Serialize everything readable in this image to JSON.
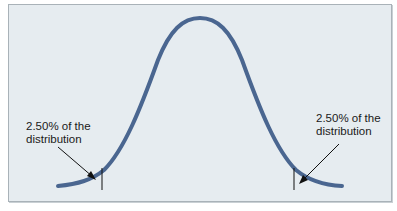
{
  "figure": {
    "type": "normal-distribution-diagram",
    "background_color": "#e6ecf0",
    "curve_color": "#4a6690",
    "left_annotation": {
      "line1": "2.50% of the",
      "line2": "distribution"
    },
    "right_annotation": {
      "line1": "2.50% of the",
      "line2": "distribution"
    }
  }
}
